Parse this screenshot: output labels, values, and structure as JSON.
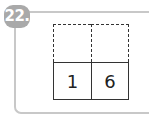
{
  "problem": {
    "number_label": "22.",
    "answer_boxes": [
      "",
      ""
    ],
    "given_digits": [
      "1",
      "6"
    ]
  },
  "colors": {
    "badge": "#a9a9a9",
    "frame": "#c8c8c8",
    "grid_lines": "#333333"
  }
}
